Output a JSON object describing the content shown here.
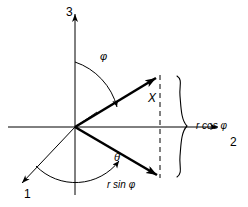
{
  "figure": {
    "type": "vector-diagram",
    "background_color": "#ffffff",
    "stroke_color": "#000000",
    "axes": [
      {
        "id": "axis-3",
        "label": "3",
        "direction": "up",
        "label_x": 66,
        "label_y": 6
      },
      {
        "id": "axis-2",
        "label": "2",
        "direction": "right",
        "label_x": 230,
        "label_y": 136
      },
      {
        "id": "axis-1",
        "label": "1",
        "direction": "down-left",
        "label_x": 24,
        "label_y": 188
      }
    ],
    "vectors": [
      {
        "id": "vector-x",
        "label": "X",
        "label_x": 148,
        "label_y": 92,
        "from": [
          75,
          127
        ],
        "to": [
          160,
          75
        ]
      },
      {
        "id": "vector-rsin",
        "label": "r sin φ",
        "label_x": 107,
        "label_y": 180,
        "from": [
          75,
          127
        ],
        "to": [
          160,
          178
        ]
      }
    ],
    "angles": [
      {
        "id": "angle-phi",
        "symbol": "φ",
        "label_x": 100,
        "label_y": 51,
        "between": "axis-3 and vector-x"
      },
      {
        "id": "angle-theta",
        "symbol": "θ",
        "label_x": 114,
        "label_y": 152,
        "between": "axis-1 and vector-rsin"
      }
    ],
    "brace": {
      "id": "brace-rcos",
      "label": "r cos φ",
      "label_x": 196,
      "label_y": 121,
      "top": 75,
      "bottom": 178,
      "x": 182
    },
    "guides": [
      {
        "id": "dashed-projection",
        "style": "dashed",
        "x": 160,
        "y1": 75,
        "y2": 178
      }
    ]
  }
}
